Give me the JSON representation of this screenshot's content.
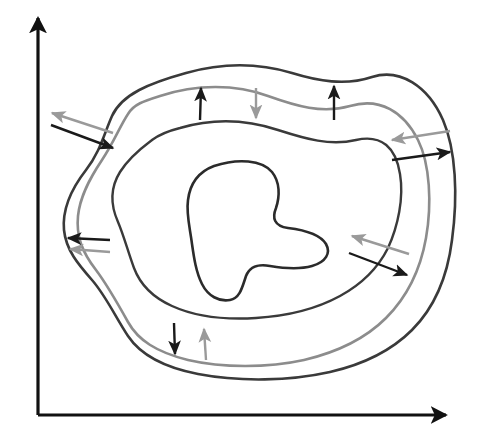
{
  "figure": {
    "background_color": "#ffffff",
    "width": 484,
    "height": 443
  },
  "axes": {
    "color": "#111111",
    "stroke_width": 3.2,
    "origin": {
      "x": 38,
      "y": 415
    },
    "y_axis": {
      "name": "vertical-axis",
      "from": {
        "x": 38,
        "y": 415
      },
      "to": {
        "x": 38,
        "y": 18
      },
      "arrowhead": "up",
      "label": ""
    },
    "x_axis": {
      "name": "horizontal-axis",
      "from": {
        "x": 38,
        "y": 415
      },
      "to": {
        "x": 446,
        "y": 415
      },
      "arrowhead": "right",
      "label": ""
    }
  },
  "colors": {
    "dark_curve": "#3a3a3a",
    "gray_curve": "#8c8c8c",
    "inner_curve": "#2b2b2b",
    "black_arrow": "#1a1a1a",
    "gray_arrow": "#9a9a9a",
    "axis": "#111111"
  },
  "curves": [
    {
      "name": "outer-dark-curve",
      "color": "#3a3a3a",
      "stroke_width": 2.6,
      "closed": true,
      "path": "M 186 73 C 225 62 262 64 292 73 C 318 81 345 86 372 77 C 400 68 428 86 443 120 C 456 150 458 196 452 240 C 447 280 434 308 412 330 C 392 350 365 364 330 372 C 290 381 240 382 198 374 C 162 367 140 354 128 336 C 116 318 106 296 92 280 C 78 264 66 250 64 230 C 62 208 72 188 86 170 C 100 152 104 134 112 116 C 122 94 150 83 186 73 Z"
    },
    {
      "name": "outer-gray-curve",
      "color": "#8c8c8c",
      "stroke_width": 2.6,
      "closed": true,
      "path": "M 160 96 C 196 84 236 84 268 96 C 296 106 322 114 350 106 C 380 97 404 112 418 140 C 430 164 432 204 426 238 C 420 272 406 298 386 318 C 366 338 338 352 304 360 C 268 368 222 368 188 360 C 156 352 138 340 128 322 C 118 304 108 286 96 270 C 82 252 76 236 78 216 C 80 196 90 178 102 160 C 114 142 120 126 128 114 C 134 104 144 101 160 96 Z"
    },
    {
      "name": "middle-dark-curve",
      "color": "#3a3a3a",
      "stroke_width": 2.4,
      "closed": true,
      "path": "M 180 128 C 214 118 248 120 278 130 C 306 139 330 146 356 140 C 382 134 396 148 400 174 C 404 198 398 226 388 248 C 378 268 362 284 340 296 C 318 308 288 316 256 318 C 224 320 194 316 172 306 C 152 297 140 284 134 268 C 128 252 124 236 118 222 C 110 204 110 188 120 172 C 130 156 144 146 152 140 C 160 134 168 131 180 128 Z"
    },
    {
      "name": "inner-blob-curve",
      "color": "#2b2b2b",
      "stroke_width": 2.6,
      "closed": true,
      "path": "M 214 166 C 238 158 262 160 272 172 C 280 182 280 196 276 208 C 272 218 274 226 288 228 C 304 230 320 234 326 244 C 331 253 326 262 312 266 C 298 270 282 268 270 266 C 258 264 250 266 246 276 C 242 288 240 298 230 300 C 219 302 208 296 202 284 C 196 272 194 258 192 244 C 190 228 186 214 188 200 C 190 184 198 172 214 166 Z"
    }
  ],
  "arrow_pairs": [
    {
      "name": "arrow-pair-upper-left",
      "location": "upper-left",
      "black_arrow": {
        "from": {
          "x": 51,
          "y": 125
        },
        "to": {
          "x": 113,
          "y": 148
        },
        "direction": "right-down",
        "color": "#1a1a1a"
      },
      "gray_arrow": {
        "from": {
          "x": 113,
          "y": 133
        },
        "to": {
          "x": 52,
          "y": 113
        },
        "direction": "left-up",
        "color": "#9a9a9a"
      }
    },
    {
      "name": "arrow-pair-top-center",
      "location": "top-center",
      "black_arrow": {
        "from": {
          "x": 200,
          "y": 120
        },
        "to": {
          "x": 201,
          "y": 88
        },
        "direction": "up",
        "color": "#1a1a1a"
      },
      "gray_arrow": {
        "from": {
          "x": 256,
          "y": 88
        },
        "to": {
          "x": 256,
          "y": 118
        },
        "direction": "down",
        "color": "#9a9a9a"
      }
    },
    {
      "name": "arrow-top-right-single",
      "location": "top-right",
      "black_arrow": {
        "from": {
          "x": 334,
          "y": 120
        },
        "to": {
          "x": 334,
          "y": 86
        },
        "direction": "up",
        "color": "#1a1a1a"
      },
      "gray_arrow": null
    },
    {
      "name": "arrow-pair-right",
      "location": "right",
      "black_arrow": {
        "from": {
          "x": 392,
          "y": 160
        },
        "to": {
          "x": 450,
          "y": 152
        },
        "direction": "right",
        "color": "#1a1a1a"
      },
      "gray_arrow": {
        "from": {
          "x": 450,
          "y": 131
        },
        "to": {
          "x": 392,
          "y": 140
        },
        "direction": "left",
        "color": "#9a9a9a"
      }
    },
    {
      "name": "arrow-pair-left-middle",
      "location": "left-middle",
      "black_arrow": {
        "from": {
          "x": 110,
          "y": 240
        },
        "to": {
          "x": 68,
          "y": 238
        },
        "direction": "left",
        "color": "#1a1a1a"
      },
      "gray_arrow": {
        "from": {
          "x": 110,
          "y": 252
        },
        "to": {
          "x": 70,
          "y": 249
        },
        "direction": "left",
        "color": "#9a9a9a"
      }
    },
    {
      "name": "arrow-pair-lower-right",
      "location": "lower-right",
      "black_arrow": {
        "from": {
          "x": 349,
          "y": 253
        },
        "to": {
          "x": 407,
          "y": 275
        },
        "direction": "right-down",
        "color": "#1a1a1a"
      },
      "gray_arrow": {
        "from": {
          "x": 409,
          "y": 254
        },
        "to": {
          "x": 352,
          "y": 236
        },
        "direction": "left-up",
        "color": "#9a9a9a"
      }
    },
    {
      "name": "arrow-pair-bottom",
      "location": "bottom-center",
      "black_arrow": {
        "from": {
          "x": 174,
          "y": 323
        },
        "to": {
          "x": 175,
          "y": 354
        },
        "direction": "down",
        "color": "#1a1a1a"
      },
      "gray_arrow": {
        "from": {
          "x": 206,
          "y": 360
        },
        "to": {
          "x": 204,
          "y": 329
        },
        "direction": "up",
        "color": "#9a9a9a"
      }
    }
  ],
  "chart_data": {
    "type": "diagram",
    "xlabel": "",
    "ylabel": "",
    "grid": false,
    "legend": "none",
    "curve_count": 4,
    "arrow_pair_count": 7
  }
}
